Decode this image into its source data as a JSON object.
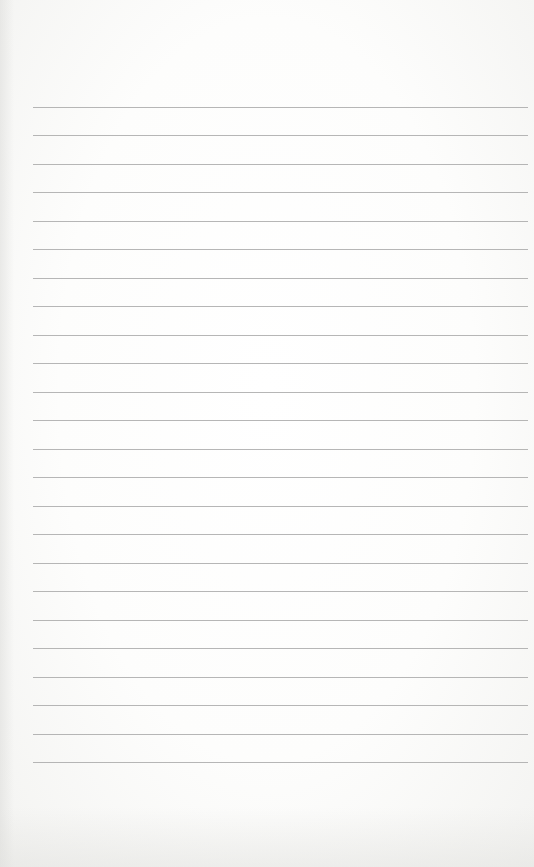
{
  "document": {
    "type": "lined-paper",
    "background_color": "#fbfbfa",
    "line_color": "#a9a9a9",
    "line_count": 24,
    "first_line_y": 107,
    "line_spacing": 28.48,
    "line_left": 33,
    "line_right": 528,
    "text_content": ""
  }
}
